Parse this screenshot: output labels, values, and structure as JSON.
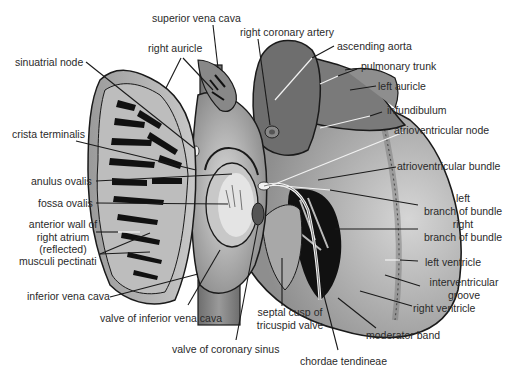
{
  "diagram": {
    "colors": {
      "background": "#ffffff",
      "tissue_dark": "#6e6e6e",
      "tissue_mid": "#8c8c8c",
      "tissue_light": "#b4b4b4",
      "tissue_pale": "#d2d2d2",
      "cavity_black": "#111111",
      "outline": "#1a1a1a",
      "leader_line_dark": "#1a1a1a",
      "leader_line_light": "#f2f2f2",
      "label_text": "#2a2a2a"
    },
    "labels": {
      "superior_vena_cava": "superior vena cava",
      "right_auricle": "right auricle",
      "sinuatrial_node": "sinuatrial node",
      "crista_terminalis": "crista terminalis",
      "anulus_ovalis": "anulus ovalis",
      "fossa_ovalis": "fossa ovalis",
      "anterior_wall": [
        "anterior wall of",
        "right atrium",
        "(reflected)"
      ],
      "musculi_pectinati": "musculi pectinati",
      "inferior_vena_cava": "inferior vena cava",
      "valve_inferior_vena_cava": "valve of inferior vena cava",
      "valve_coronary_sinus": "valve of coronary sinus",
      "septal_cusp": [
        "septal cusp of",
        "tricuspid valve"
      ],
      "chordae_tendineae": "chordae tendineae",
      "moderator_band": "moderator band",
      "right_ventricle": "right ventricle",
      "interventricular_groove": [
        "interventricular",
        "groove"
      ],
      "left_ventricle": "left ventricle",
      "right_branch": [
        "right",
        "branch of bundle"
      ],
      "left_branch": [
        "left",
        "branch of bundle"
      ],
      "atrioventricular_bundle": "atrioventricular bundle",
      "atrioventricular_node": "atrioventricular node",
      "infundibulum": "infundibulum",
      "left_auricle": "left auricle",
      "pulmonary_trunk": "pulmonary trunk",
      "ascending_aorta": "ascending aorta",
      "right_coronary_artery": "right coronary artery"
    }
  }
}
